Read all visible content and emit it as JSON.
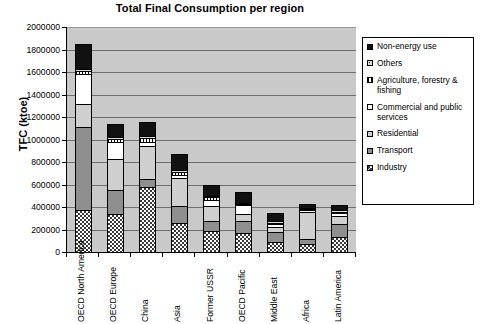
{
  "chart_data": {
    "type": "bar",
    "subtype": "stacked-vertical",
    "title": "Total Final Consumption per region",
    "xlabel": "",
    "ylabel": "TFC (ktoe)",
    "ylim": [
      0,
      2000000
    ],
    "ytick_step": 200000,
    "yticks": [
      "2000000",
      "1800000",
      "1600000",
      "1400000",
      "1200000",
      "1000000",
      "800000",
      "600000",
      "400000",
      "200000",
      "0"
    ],
    "grid": true,
    "grid_axis": "y",
    "legend_position": "right",
    "plot_background": "#c9c9c9",
    "categories": [
      "OECD North America",
      "OECD Europe",
      "China",
      "Asia",
      "Former USSR",
      "OECD Pacific",
      "Middle East",
      "Africa",
      "Latin America"
    ],
    "series": [
      {
        "name": "Industry",
        "swatch": "checkered-dark",
        "color": "#3a3a3a",
        "values": [
          375000,
          340000,
          575000,
          255000,
          190000,
          165000,
          90000,
          75000,
          135000
        ]
      },
      {
        "name": "Transport",
        "swatch": "solid-mid-gray",
        "color": "#8f8f8f",
        "values": [
          740000,
          210000,
          75000,
          155000,
          85000,
          115000,
          85000,
          40000,
          115000
        ]
      },
      {
        "name": "Residential",
        "swatch": "solid-light-gray",
        "color": "#cfcfcf",
        "values": [
          200000,
          275000,
          290000,
          245000,
          130000,
          60000,
          45000,
          245000,
          70000
        ]
      },
      {
        "name": "Commercial and public services",
        "swatch": "white",
        "color": "#ffffff",
        "values": [
          265000,
          155000,
          35000,
          30000,
          60000,
          75000,
          30000,
          15000,
          25000
        ]
      },
      {
        "name": "Agriculture, forestry & fishing",
        "swatch": "white-hatched",
        "color": "#ffffff",
        "values": [
          25000,
          25000,
          40000,
          30000,
          20000,
          10000,
          10000,
          10000,
          15000
        ]
      },
      {
        "name": "Others",
        "swatch": "dotted",
        "color": "#d8d8d8",
        "values": [
          20000,
          20000,
          15000,
          15000,
          15000,
          10000,
          15000,
          10000,
          10000
        ]
      },
      {
        "name": "Non-energy use",
        "swatch": "black",
        "color": "#111111",
        "values": [
          225000,
          115000,
          125000,
          145000,
          100000,
          95000,
          70000,
          35000,
          50000
        ]
      }
    ],
    "totals": [
      1850000,
      1140000,
      1155000,
      875000,
      600000,
      530000,
      345000,
      430000,
      420000
    ]
  },
  "legend": {
    "items": [
      {
        "label": "Non-energy use"
      },
      {
        "label": "Others"
      },
      {
        "label": "Agriculture, forestry & fishing"
      },
      {
        "label": "Commercial and public services"
      },
      {
        "label": "Residential"
      },
      {
        "label": "Transport"
      },
      {
        "label": "Industry"
      }
    ]
  }
}
